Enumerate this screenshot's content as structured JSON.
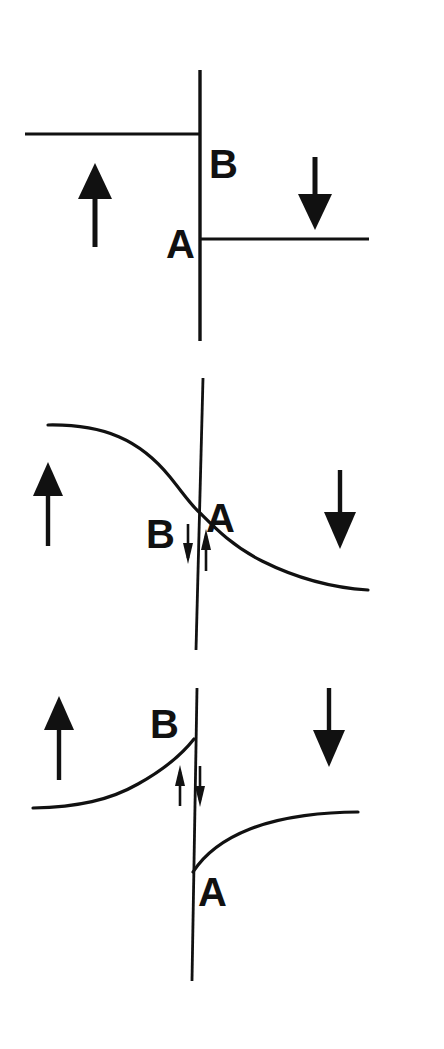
{
  "figure": {
    "background_color": "#ffffff",
    "ink_color": "#111111",
    "width": 444,
    "height": 1049
  },
  "labels": {
    "A": "A",
    "B": "B"
  },
  "icons": {
    "up_arrow": "arrow-up-icon",
    "down_arrow": "arrow-down-icon",
    "small_up_arrow": "small-arrow-up-icon",
    "small_down_arrow": "small-arrow-down-icon",
    "vertical_boundary": "vertical-boundary-line-icon"
  },
  "panels": [
    {
      "id": "panel-top",
      "name": "step-discontinuity-panel",
      "description": "Two horizontal levels meeting an abrupt vertical boundary; upper-left level ends at B, lower-right level begins at A",
      "boundary": {
        "x1": 200,
        "y1": 70,
        "x2": 200,
        "y2": 341
      },
      "level_left": {
        "x1": 25,
        "y1": 134,
        "x2": 201,
        "y2": 134
      },
      "level_right": {
        "x1": 199,
        "y1": 239,
        "x2": 369,
        "y2": 239
      },
      "label_B": {
        "text": "B",
        "x": 209,
        "y": 150
      },
      "label_A": {
        "text": "A",
        "x": 168,
        "y": 255
      },
      "bulk_arrow_left": {
        "direction": "up",
        "x": 95,
        "y_tip": 164,
        "y_tail": 246
      },
      "bulk_arrow_right": {
        "direction": "down",
        "x": 315,
        "y_tail": 157,
        "y_tip": 229
      },
      "small_arrows": []
    },
    {
      "id": "panel-middle",
      "name": "smooth-sigmoid-panel",
      "description": "A single continuous S-shaped curve descending through the vertical boundary; B sits left of the crossing, A right of it",
      "boundary": {
        "x1": 203,
        "y1": 378,
        "x2": 196,
        "y2": 650
      },
      "curve": {
        "shape": "descending-sigmoid",
        "start": [
          48,
          425
        ],
        "end": [
          368,
          590
        ],
        "crossing": [
          199,
          512
        ]
      },
      "label_B": {
        "text": "B",
        "x": 148,
        "y": 522
      },
      "label_A": {
        "text": "A",
        "x": 206,
        "y": 505
      },
      "bulk_arrow_left": {
        "direction": "up",
        "x": 48,
        "y_tip": 463,
        "y_tail": 545
      },
      "bulk_arrow_right": {
        "direction": "down",
        "x": 340,
        "y_tail": 470,
        "y_tip": 548
      },
      "small_arrows": [
        {
          "direction": "down",
          "side": "left",
          "x": 188,
          "y_tail": 525,
          "y_tip": 562
        },
        {
          "direction": "up",
          "side": "right",
          "x": 205,
          "y_tip": 530,
          "y_tail": 570
        }
      ]
    },
    {
      "id": "panel-bottom",
      "name": "split-exponential-panel",
      "description": "Two separate exponential curves; left curve rises to B at the boundary, right curve rises from A below the boundary",
      "boundary": {
        "x1": 197,
        "y1": 688,
        "x2": 192,
        "y2": 981
      },
      "curve_left": {
        "shape": "rising-exponential",
        "start": [
          33,
          808
        ],
        "end": [
          194,
          740
        ]
      },
      "curve_right": {
        "shape": "rising-exponential",
        "start": [
          193,
          872
        ],
        "end": [
          358,
          812
        ]
      },
      "label_B": {
        "text": "B",
        "x": 152,
        "y": 736
      },
      "label_A": {
        "text": "A",
        "x": 199,
        "y": 894
      },
      "bulk_arrow_left": {
        "direction": "up",
        "x": 59,
        "y_tip": 697,
        "y_tail": 779
      },
      "bulk_arrow_right": {
        "direction": "down",
        "x": 329,
        "y_tail": 688,
        "y_tip": 766
      },
      "small_arrows": [
        {
          "direction": "up",
          "side": "left",
          "x": 180,
          "y_tip": 766,
          "y_tail": 806
        },
        {
          "direction": "down",
          "side": "right",
          "x": 199,
          "y_tail": 766,
          "y_tip": 806
        }
      ]
    }
  ]
}
